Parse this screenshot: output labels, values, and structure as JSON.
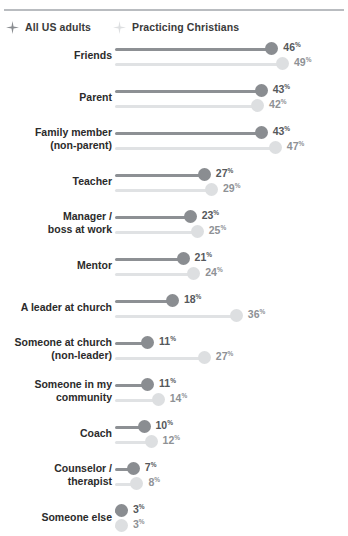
{
  "legend": {
    "items": [
      {
        "label": "All US adults",
        "marker": "sparkle-icon",
        "color": "#8a8d91"
      },
      {
        "label": "Practicing Christians",
        "marker": "sparkle-icon",
        "color": "#dddfe1"
      }
    ]
  },
  "chart_data": {
    "type": "bar",
    "title": "",
    "xlabel": "",
    "ylabel": "",
    "xlim": [
      0,
      60
    ],
    "grid": false,
    "legend_position": "top-left",
    "value_suffix": "%",
    "categories": [
      "Friends",
      "Parent",
      "Family member\n(non-parent)",
      "Teacher",
      "Manager /\nboss at work",
      "Mentor",
      "A leader at church",
      "Someone at church\n(non-leader)",
      "Someone in my\ncommunity",
      "Coach",
      "Counselor /\ntherapist",
      "Someone else"
    ],
    "series": [
      {
        "name": "All US adults",
        "color": "#8a8d91",
        "values": [
          46,
          43,
          43,
          27,
          23,
          21,
          18,
          11,
          11,
          10,
          7,
          3
        ]
      },
      {
        "name": "Practicing Christians",
        "color": "#dddfe1",
        "values": [
          49,
          42,
          47,
          29,
          25,
          24,
          36,
          27,
          14,
          12,
          8,
          3
        ]
      }
    ]
  }
}
